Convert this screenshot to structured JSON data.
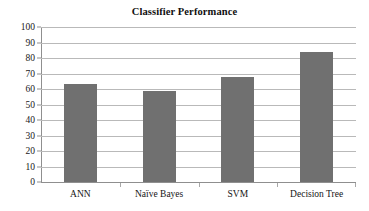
{
  "chart_data": {
    "type": "bar",
    "title": "Classifier Performance",
    "xlabel": "",
    "ylabel": "",
    "categories": [
      "ANN",
      "Naïve Bayes",
      "SVM",
      "Decision Tree"
    ],
    "values": [
      63,
      59,
      68,
      84
    ],
    "ylim": [
      0,
      100
    ],
    "ytick_step": 10,
    "yticks": [
      100,
      90,
      80,
      70,
      60,
      50,
      40,
      30,
      20,
      10,
      0
    ],
    "ytick_labels": [
      "100",
      "90",
      "80",
      "70",
      "60",
      "50",
      "40",
      "30",
      "20",
      "10",
      "0"
    ],
    "grid": true,
    "grid_axis": "y",
    "legend": false,
    "legend_position": "none",
    "series": [
      {
        "name": "Accuracy",
        "values": [
          63,
          59,
          68,
          84
        ],
        "color": "#707070"
      }
    ],
    "colors": {
      "bar": "#707070",
      "gridline": "#b9b9b9",
      "axis": "#8f8f8f",
      "text": "#151515",
      "background": "#ffffff"
    }
  }
}
